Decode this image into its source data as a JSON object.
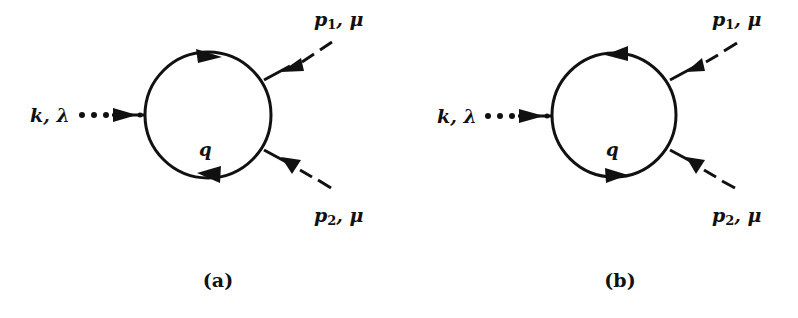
{
  "figure": {
    "colors": {
      "ink": "#111111",
      "background": "#ffffff"
    },
    "panels": [
      {
        "id": "a",
        "caption": "(a)",
        "incoming": {
          "symbol": "k",
          "index": "λ",
          "line_style": "dotted"
        },
        "loop_label": "q",
        "loop_orientation": "clockwise",
        "top_arrow_direction": "right",
        "bottom_arrow_direction": "left",
        "external_legs": [
          {
            "symbol": "p",
            "subscript": "1",
            "index": "μ",
            "line_style": "dashed",
            "position": "upper-right"
          },
          {
            "symbol": "p",
            "subscript": "2",
            "index": "μ",
            "line_style": "dashed",
            "position": "lower-right"
          }
        ]
      },
      {
        "id": "b",
        "caption": "(b)",
        "incoming": {
          "symbol": "k",
          "index": "λ",
          "line_style": "dotted"
        },
        "loop_label": "q",
        "loop_orientation": "counter-clockwise",
        "top_arrow_direction": "left",
        "bottom_arrow_direction": "right",
        "external_legs": [
          {
            "symbol": "p",
            "subscript": "1",
            "index": "μ",
            "line_style": "dashed",
            "position": "upper-right"
          },
          {
            "symbol": "p",
            "subscript": "2",
            "index": "μ",
            "line_style": "dashed",
            "position": "lower-right"
          }
        ]
      }
    ]
  },
  "labels": {
    "a": {
      "k": "k, λ",
      "p1": "p",
      "p1_sub": "1",
      "p1_idx": ", μ",
      "p2": "p",
      "p2_sub": "2",
      "p2_idx": ", μ",
      "q": "q",
      "caption": "(a)"
    },
    "b": {
      "k": "k, λ",
      "p1": "p",
      "p1_sub": "1",
      "p1_idx": ", μ",
      "p2": "p",
      "p2_sub": "2",
      "p2_idx": ", μ",
      "q": "q",
      "caption": "(b)"
    }
  }
}
